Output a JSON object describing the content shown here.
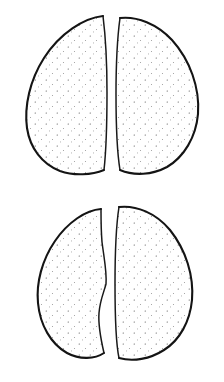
{
  "figure": {
    "title": "Split seed cotyledon pairs",
    "medium": "pen-and-ink stipple line art",
    "background_color": "#ffffff",
    "ink_color": "#1a1a1a",
    "outline_color": "#141414",
    "interior_color": "#fdfdfd",
    "canvas": {
      "width": 224,
      "height": 382
    },
    "specimen_count": 2,
    "halves_per_specimen": 2
  },
  "specimens": [
    {
      "id": "specimen-top",
      "label": "Upper seed",
      "bbox": {
        "x": 24,
        "y": 14,
        "width": 176,
        "height": 161
      },
      "gap": {
        "x": 107,
        "width": 10
      },
      "halves": [
        {
          "id": "half-top-left",
          "label": "Upper left cotyledon",
          "orientation": "left",
          "bbox": {
            "x": 24,
            "y": 14,
            "width": 84,
            "height": 161
          },
          "inner_edge": "straight",
          "outer_edge": "convex"
        },
        {
          "id": "half-top-right",
          "label": "Upper right cotyledon",
          "orientation": "right",
          "bbox": {
            "x": 117,
            "y": 17,
            "width": 83,
            "height": 158
          },
          "inner_edge": "slightly-concave",
          "outer_edge": "convex"
        }
      ]
    },
    {
      "id": "specimen-bottom",
      "label": "Lower seed",
      "bbox": {
        "x": 36,
        "y": 205,
        "width": 157,
        "height": 156
      },
      "gap": {
        "x": 106,
        "width": 9
      },
      "halves": [
        {
          "id": "half-bottom-left",
          "label": "Lower left cotyledon",
          "orientation": "left",
          "bbox": {
            "x": 36,
            "y": 207,
            "width": 70,
            "height": 152
          },
          "inner_edge": "concave-notched",
          "outer_edge": "convex"
        },
        {
          "id": "half-bottom-right",
          "label": "Lower right cotyledon",
          "orientation": "right",
          "bbox": {
            "x": 115,
            "y": 205,
            "width": 78,
            "height": 155
          },
          "inner_edge": "straight",
          "outer_edge": "convex"
        }
      ]
    }
  ]
}
